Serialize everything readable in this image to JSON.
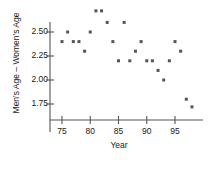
{
  "chart_data": {
    "type": "scatter",
    "title": "",
    "xlabel": "Year",
    "ylabel": "Men's Age – Women's Age",
    "xlim": [
      73.5,
      99.5
    ],
    "ylim": [
      1.62,
      2.78
    ],
    "xticks": [
      75,
      80,
      85,
      90,
      95
    ],
    "yticks": [
      2.5,
      2.25,
      2.0,
      1.75
    ],
    "ytick_labels": [
      "2.50",
      "2.25",
      "2.00",
      "1.75"
    ],
    "xtick_labels": [
      "75",
      "80",
      "85",
      "90",
      "95"
    ],
    "grid": false,
    "legend": null,
    "marker": "square",
    "marker_color": "#555555",
    "marker_size_px": 3,
    "axis_color": "#555555",
    "x": [
      75,
      76,
      77,
      78,
      79,
      80,
      81,
      82,
      83,
      84,
      85,
      86,
      87,
      88,
      89,
      90,
      91,
      92,
      93,
      94,
      95,
      96,
      97,
      98
    ],
    "y": [
      2.4,
      2.5,
      2.4,
      2.4,
      2.3,
      2.5,
      2.72,
      2.72,
      2.6,
      2.4,
      2.2,
      2.6,
      2.2,
      2.3,
      2.4,
      2.2,
      2.2,
      2.1,
      2.0,
      2.2,
      2.4,
      2.3,
      1.8,
      1.72
    ],
    "points": [
      {
        "year": 75,
        "diff": 2.4
      },
      {
        "year": 76,
        "diff": 2.5
      },
      {
        "year": 77,
        "diff": 2.4
      },
      {
        "year": 78,
        "diff": 2.4
      },
      {
        "year": 79,
        "diff": 2.3
      },
      {
        "year": 80,
        "diff": 2.5
      },
      {
        "year": 81,
        "diff": 2.72
      },
      {
        "year": 82,
        "diff": 2.72
      },
      {
        "year": 83,
        "diff": 2.6
      },
      {
        "year": 84,
        "diff": 2.4
      },
      {
        "year": 85,
        "diff": 2.2
      },
      {
        "year": 86,
        "diff": 2.6
      },
      {
        "year": 87,
        "diff": 2.2
      },
      {
        "year": 88,
        "diff": 2.3
      },
      {
        "year": 89,
        "diff": 2.4
      },
      {
        "year": 90,
        "diff": 2.2
      },
      {
        "year": 91,
        "diff": 2.2
      },
      {
        "year": 92,
        "diff": 2.1
      },
      {
        "year": 93,
        "diff": 2.0
      },
      {
        "year": 94,
        "diff": 2.2
      },
      {
        "year": 95,
        "diff": 2.4
      },
      {
        "year": 96,
        "diff": 2.3
      },
      {
        "year": 97,
        "diff": 1.8
      },
      {
        "year": 98,
        "diff": 1.72
      }
    ]
  },
  "axes": {
    "y_title": "Men's Age – Women's Age",
    "x_title": "Year"
  }
}
